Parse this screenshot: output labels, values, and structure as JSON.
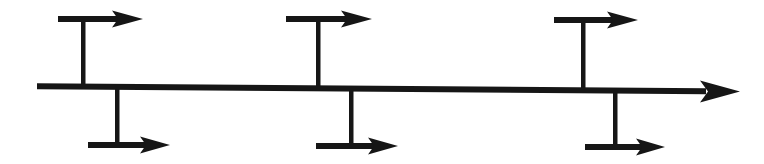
{
  "document": {
    "title": "Fishbone Diagram Skeleton",
    "type": "ishikawa-cause-and-effect-diagram",
    "description": "Blank fishbone diagram outline with one horizontal spine arrow and six unlabeled branch arrows",
    "background_color": "#ffffff",
    "ink_color": "#161616",
    "width": 764,
    "height": 164
  },
  "diagram_data": {
    "type": "diagram",
    "shape_count": 7,
    "spine": {
      "label": "",
      "name": "main-spine-arrow",
      "direction": "right",
      "start_x": 37,
      "start_y": 86,
      "end_x": 740,
      "end_y": 91,
      "thickness": 6,
      "arrow_head_length": 34,
      "arrow_head_width": 22
    },
    "branches_top": [
      {
        "label": "",
        "name": "branch-top-1",
        "bar_start_x": 58,
        "bar_end_x": 143,
        "bar_y": 19,
        "stem_x": 83,
        "stem_bottom_y": 88,
        "direction": "right"
      },
      {
        "label": "",
        "name": "branch-top-2",
        "bar_start_x": 286,
        "bar_end_x": 372,
        "bar_y": 19,
        "stem_x": 318,
        "stem_bottom_y": 89,
        "direction": "right"
      },
      {
        "label": "",
        "name": "branch-top-3",
        "bar_start_x": 554,
        "bar_end_x": 638,
        "bar_y": 20,
        "stem_x": 583,
        "stem_bottom_y": 90,
        "direction": "right"
      }
    ],
    "branches_bottom": [
      {
        "label": "",
        "name": "branch-bottom-1",
        "bar_start_x": 88,
        "bar_end_x": 170,
        "bar_y": 145,
        "stem_x": 117,
        "stem_top_y": 88,
        "direction": "right"
      },
      {
        "label": "",
        "name": "branch-bottom-2",
        "bar_start_x": 316,
        "bar_end_x": 398,
        "bar_y": 146,
        "stem_x": 351,
        "stem_top_y": 89,
        "direction": "right"
      },
      {
        "label": "",
        "name": "branch-bottom-3",
        "bar_start_x": 585,
        "bar_end_x": 665,
        "bar_y": 147,
        "stem_x": 615,
        "stem_top_y": 91,
        "direction": "right"
      }
    ],
    "style": {
      "bar_thickness": 6,
      "stem_thickness": 4,
      "branch_arrow_head_length": 28,
      "branch_arrow_head_width": 18
    }
  }
}
